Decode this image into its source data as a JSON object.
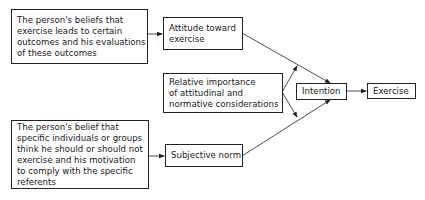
{
  "diagram": {
    "nodes": {
      "behavioral_beliefs": {
        "lines": [
          "The person's beliefs that",
          "exercise leads to certain",
          "outcomes and his evaluations",
          "of these outcomes"
        ]
      },
      "attitude": {
        "lines": [
          "Attitude toward",
          "exercise"
        ]
      },
      "relative_importance": {
        "lines": [
          "Relative importance",
          "of attitudinal and",
          "normative considerations"
        ]
      },
      "normative_beliefs": {
        "lines": [
          "The person's belief that",
          "specific individuals or groups",
          "think he should or should not",
          "exercise and his motivation",
          "to comply with the specific",
          "referents"
        ]
      },
      "subjective_norm": {
        "lines": [
          "Subjective norm"
        ]
      },
      "intention": {
        "lines": [
          "Intention"
        ]
      },
      "exercise": {
        "lines": [
          "Exercise"
        ]
      }
    },
    "edges": [
      {
        "from": "behavioral_beliefs",
        "to": "attitude"
      },
      {
        "from": "normative_beliefs",
        "to": "subjective_norm"
      },
      {
        "from": "attitude",
        "to": "intention"
      },
      {
        "from": "subjective_norm",
        "to": "intention"
      },
      {
        "from": "relative_importance",
        "to": "attitude-intention link"
      },
      {
        "from": "relative_importance",
        "to": "subjective_norm-intention link"
      },
      {
        "from": "intention",
        "to": "exercise"
      }
    ],
    "colors": {
      "line": "#222222",
      "background": "#ffffff"
    }
  }
}
